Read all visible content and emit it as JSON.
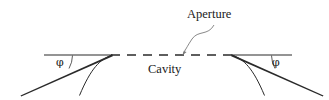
{
  "figure": {
    "type": "line-diagram",
    "title": "",
    "background_color": "#ffffff",
    "stroke_color": "#1a1a1a",
    "labels": {
      "aperture": "Aperture",
      "cavity": "Cavity",
      "phi_left": "φ",
      "phi_right": "φ"
    },
    "annotations": {
      "aperture_pointer": "curved-arrow-to-dashed-line",
      "angle_left": "φ",
      "angle_right": "φ"
    },
    "geometry": {
      "surface_line_left": {
        "x1": 44,
        "y1": 55,
        "x2": 112,
        "y2": 55
      },
      "surface_line_right": {
        "x1": 232,
        "y1": 55,
        "x2": 292,
        "y2": 55
      },
      "dashed_cavity_line": {
        "x1": 112,
        "y1": 55,
        "x2": 232,
        "y2": 55
      },
      "dash_pattern": "9 7",
      "angle_arc_left_degrees": 22,
      "angle_arc_right_degrees": 22
    }
  }
}
